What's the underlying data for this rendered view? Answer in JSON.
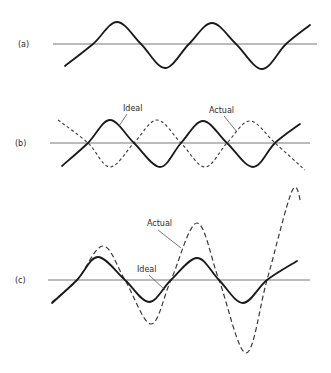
{
  "figure": {
    "panels": [
      {
        "id": "a",
        "label": "(a)",
        "label_pos": [
          18,
          47
        ],
        "axis": {
          "x0": 53,
          "x1": 317,
          "y": 44
        },
        "curves": [
          {
            "name": "Waveform",
            "style": "solid",
            "points": [
              [
                65,
                66
              ],
              [
                93,
                44
              ],
              [
                117,
                22
              ],
              [
                141,
                44
              ],
              [
                165,
                68
              ],
              [
                189,
                44
              ],
              [
                212,
                23
              ],
              [
                236,
                44
              ],
              [
                262,
                69
              ],
              [
                286,
                44
              ],
              [
                310,
                25
              ]
            ]
          }
        ],
        "callouts": []
      },
      {
        "id": "b",
        "label": "(b)",
        "label_pos": [
          15,
          146
        ],
        "axis": {
          "x0": 50,
          "x1": 310,
          "y": 143
        },
        "curves": [
          {
            "name": "Ideal",
            "style": "solid",
            "points": [
              [
                62,
                166
              ],
              [
                88,
                143
              ],
              [
                110,
                120
              ],
              [
                134,
                143
              ],
              [
                160,
                167
              ],
              [
                181,
                143
              ],
              [
                203,
                121
              ],
              [
                227,
                143
              ],
              [
                253,
                167
              ],
              [
                275,
                143
              ],
              [
                300,
                124
              ]
            ]
          },
          {
            "name": "Actual",
            "style": "dashed",
            "points": [
              [
                58,
                120
              ],
              [
                88,
                143
              ],
              [
                110,
                167
              ],
              [
                134,
                143
              ],
              [
                157,
                120
              ],
              [
                181,
                143
              ],
              [
                205,
                167
              ],
              [
                227,
                143
              ],
              [
                250,
                121
              ],
              [
                275,
                143
              ],
              [
                305,
                170
              ]
            ]
          }
        ],
        "callouts": [
          {
            "text": "Ideal",
            "text_pos": [
              123,
              111
            ],
            "line": [
              [
                127,
                114
              ],
              [
                119,
                126
              ]
            ]
          },
          {
            "text": "Actual",
            "text_pos": [
              209,
              113
            ],
            "line": [
              [
                224,
                116
              ],
              [
                237,
                132
              ]
            ]
          }
        ]
      },
      {
        "id": "c",
        "label": "(c)",
        "label_pos": [
          15,
          283
        ],
        "axis": {
          "x0": 48,
          "x1": 310,
          "y": 280
        },
        "curves": [
          {
            "name": "Ideal",
            "style": "solid",
            "points": [
              [
                52,
                303
              ],
              [
                77,
                280
              ],
              [
                98,
                257
              ],
              [
                125,
                280
              ],
              [
                149,
                302
              ],
              [
                171,
                280
              ],
              [
                197,
                258
              ],
              [
                219,
                280
              ],
              [
                243,
                303
              ],
              [
                267,
                280
              ],
              [
                297,
                261
              ]
            ]
          },
          {
            "name": "Actual",
            "style": "dashed",
            "points": [
              [
                52,
                302
              ],
              [
                77,
                280
              ],
              [
                103,
                246
              ],
              [
                125,
                280
              ],
              [
                151,
                324
              ],
              [
                171,
                280
              ],
              [
                197,
                223
              ],
              [
                219,
                280
              ],
              [
                246,
                353
              ],
              [
                267,
                280
              ],
              [
                292,
                191
              ],
              [
                301,
                203
              ]
            ]
          }
        ],
        "callouts": [
          {
            "text": "Actual",
            "text_pos": [
              147,
              226
            ],
            "line": [
              [
                158,
                230
              ],
              [
                181,
                248
              ]
            ]
          },
          {
            "text": "Ideal",
            "text_pos": [
              137,
              272
            ],
            "line": [
              [
                149,
                275
              ],
              [
                165,
                290
              ]
            ]
          }
        ]
      }
    ]
  }
}
